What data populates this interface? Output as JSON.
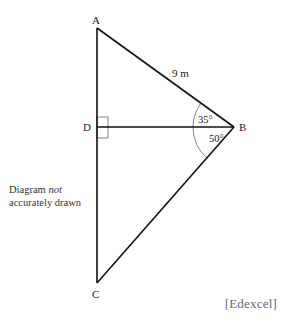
{
  "diagram": {
    "points": {
      "A": {
        "label": "A",
        "x": 97,
        "y": 28
      },
      "D": {
        "label": "D",
        "x": 97,
        "y": 127
      },
      "B": {
        "label": "B",
        "x": 234,
        "y": 127
      },
      "C": {
        "label": "C",
        "x": 97,
        "y": 283
      }
    },
    "segments": [
      "AB",
      "AC",
      "DB",
      "BC"
    ],
    "lengths": {
      "AB": "9 m"
    },
    "angles": {
      "ABD": "35°",
      "DBC": "50°"
    },
    "right_angle_at": "D",
    "colors": {
      "lines": "#111111",
      "construction": "#777777",
      "source": "#6a6a6a"
    }
  },
  "note": {
    "line1_prefix": "Diagram ",
    "line1_emph": "not",
    "line2": "accurately drawn"
  },
  "source": "[Edexcel]"
}
